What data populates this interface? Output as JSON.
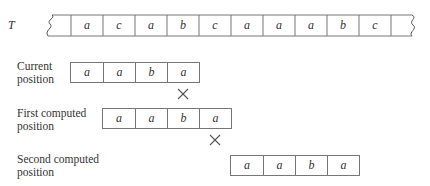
{
  "text_label": "T",
  "text_cells": [
    "",
    "a",
    "c",
    "a",
    "b",
    "c",
    "a",
    "a",
    "a",
    "b",
    "c",
    ""
  ],
  "pattern_rows": [
    {
      "label_line1": "Current",
      "label_line2": "position",
      "cells": [
        "a",
        "a",
        "b",
        "a"
      ],
      "mismatch_marker": "×"
    },
    {
      "label_line1": "First computed",
      "label_line2": "position",
      "cells": [
        "a",
        "a",
        "b",
        "a"
      ],
      "mismatch_marker": "×"
    },
    {
      "label_line1": "Second computed",
      "label_line2": "position",
      "cells": [
        "a",
        "a",
        "b",
        "a"
      ]
    }
  ],
  "colors": {
    "line": "#777777",
    "text": "#333333",
    "background": "#ffffff"
  }
}
